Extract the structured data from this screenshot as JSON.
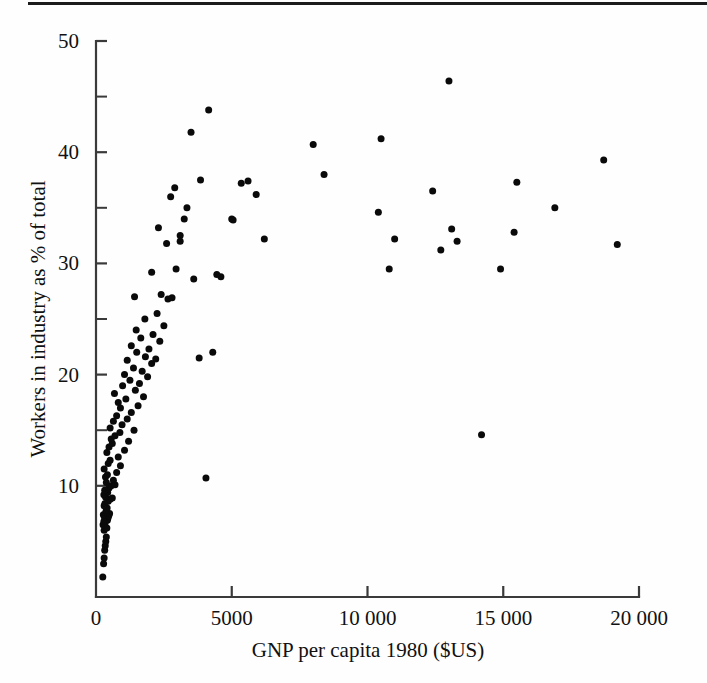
{
  "figure": {
    "top_rule": "horizontal-rule",
    "background_color": "#fefefe",
    "ink_color": "#0a0a0a"
  },
  "chart_data": {
    "type": "scatter",
    "title": "",
    "subtitle": "",
    "xlabel": "GNP per capita 1980 ($US)",
    "ylabel": "Workers in industry as % of total",
    "xlim": [
      0,
      20000
    ],
    "ylim": [
      0,
      50
    ],
    "grid": false,
    "legend": null,
    "legend_position": "none",
    "marker": "filled-circle",
    "marker_color": "#0a0a0a",
    "marker_size_px": 7,
    "xticks": [
      0,
      5000,
      10000,
      15000,
      20000
    ],
    "xtick_labels": [
      "0",
      "5000",
      "10 000",
      "15 000",
      "20 000"
    ],
    "yticks": [
      10,
      20,
      30,
      40,
      50
    ],
    "ytick_labels": [
      "10",
      "20",
      "30",
      "40",
      "50"
    ],
    "yticks_minor": [
      15,
      25,
      35,
      45
    ],
    "x": [
      250,
      280,
      300,
      320,
      340,
      360,
      380,
      300,
      400,
      260,
      330,
      290,
      420,
      350,
      440,
      310,
      470,
      270,
      500,
      360,
      380,
      410,
      300,
      330,
      450,
      520,
      350,
      290,
      600,
      430,
      320,
      480,
      560,
      700,
      380,
      640,
      350,
      420,
      760,
      300,
      900,
      450,
      520,
      820,
      400,
      1050,
      480,
      600,
      1200,
      560,
      700,
      880,
      1400,
      520,
      960,
      640,
      1150,
      760,
      1300,
      900,
      1550,
      820,
      1100,
      1750,
      680,
      1450,
      980,
      1600,
      1250,
      1900,
      1050,
      1700,
      1380,
      2050,
      1150,
      1820,
      2200,
      1500,
      1950,
      1300,
      2350,
      1650,
      2100,
      1480,
      2500,
      1800,
      2250,
      2650,
      1420,
      2400,
      2800,
      2050,
      2950,
      2600,
      3100,
      2300,
      3350,
      2750,
      3600,
      2900,
      3250,
      3850,
      3100,
      4050,
      3500,
      4300,
      3800,
      4600,
      4150,
      5000,
      4450,
      5350,
      5600,
      5900,
      6200,
      5050,
      8000,
      8400,
      10400,
      10500,
      11000,
      10800,
      12400,
      12700,
      13000,
      13100,
      13300,
      14200,
      14900,
      15400,
      15500,
      16900,
      18700,
      19200
    ],
    "y": [
      1.8,
      3.0,
      3.5,
      4.2,
      4.6,
      5.0,
      5.4,
      6.0,
      6.2,
      6.5,
      6.6,
      6.8,
      6.9,
      7.0,
      7.1,
      7.2,
      7.3,
      7.4,
      7.5,
      7.6,
      7.8,
      8.0,
      8.2,
      8.4,
      8.6,
      8.8,
      9.0,
      9.2,
      8.9,
      9.4,
      9.6,
      9.8,
      10.0,
      10.1,
      10.3,
      10.5,
      10.8,
      11.0,
      11.2,
      11.5,
      11.8,
      12.0,
      12.3,
      12.6,
      13.0,
      13.2,
      13.5,
      13.8,
      14.0,
      14.2,
      14.5,
      14.8,
      15.0,
      15.2,
      15.5,
      15.8,
      16.0,
      16.3,
      16.6,
      17.0,
      17.2,
      17.5,
      17.8,
      18.0,
      18.3,
      18.6,
      19.0,
      19.2,
      19.5,
      19.8,
      20.0,
      20.3,
      20.6,
      21.0,
      21.3,
      21.6,
      21.4,
      22.0,
      22.3,
      22.6,
      23.0,
      23.3,
      23.6,
      24.0,
      24.4,
      25.0,
      25.5,
      26.8,
      27.0,
      27.2,
      26.9,
      29.2,
      29.5,
      31.8,
      32.0,
      33.2,
      35.0,
      36.0,
      28.6,
      36.8,
      34.0,
      37.5,
      32.5,
      10.7,
      41.8,
      22.0,
      21.5,
      28.8,
      43.8,
      34.0,
      29.0,
      37.2,
      37.4,
      36.2,
      32.2,
      33.9,
      40.7,
      38.0,
      34.6,
      41.2,
      32.2,
      29.5,
      36.5,
      31.2,
      46.4,
      33.1,
      32.0,
      14.6,
      29.5,
      32.8,
      37.3,
      35.0,
      39.3,
      31.7
    ]
  }
}
